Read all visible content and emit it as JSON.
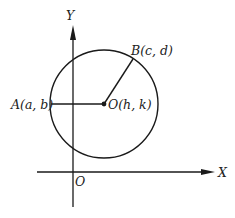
{
  "diagram": {
    "axes": {
      "x_label": "X",
      "y_label": "Y",
      "origin_label": "O"
    },
    "circle": {
      "center_label": "O(h, k)",
      "point_a_label": "A(a, b)",
      "point_b_label": "B(c, d)"
    },
    "colors": {
      "stroke": "#1a1a1a",
      "background": "#ffffff"
    }
  }
}
